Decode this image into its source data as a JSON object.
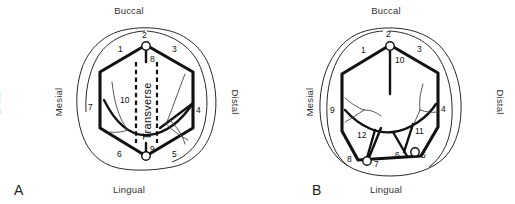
{
  "figure": {
    "background_color": "#ffffff",
    "line_color": "#111111",
    "outline_color": "#2a2a2a"
  },
  "panels": [
    {
      "letter": "A",
      "orientation": {
        "top": "Buccal",
        "bottom": "Lingual",
        "left": "Mesial",
        "right": "Distal"
      },
      "center_label": "Transverse",
      "numbers": [
        "1",
        "2",
        "3",
        "4",
        "5",
        "6",
        "7",
        "8",
        "9",
        "10"
      ],
      "nodes": [
        {
          "label": "2",
          "position": "buccal-apex"
        },
        {
          "label": "9",
          "position": "lingual-apex"
        }
      ]
    },
    {
      "letter": "B",
      "orientation": {
        "top": "Buccal",
        "bottom": "Lingual",
        "left": "Mesial",
        "right": "Distal",
        "far_left": "Distal"
      },
      "center_label": "",
      "numbers": [
        "1",
        "2",
        "3",
        "4",
        "5",
        "6",
        "7",
        "8",
        "9",
        "10",
        "11",
        "12"
      ],
      "nodes": [
        {
          "label": "2",
          "position": "buccal-apex"
        },
        {
          "label": "7",
          "position": "lingual-mesial"
        },
        {
          "label": "5",
          "position": "lingual-distal"
        }
      ]
    }
  ],
  "panel_a_numbers": {
    "n1": "1",
    "n2": "2",
    "n3": "3",
    "n4": "4",
    "n5": "5",
    "n6": "6",
    "n7": "7",
    "n8": "8",
    "n9": "9",
    "n10": "10"
  },
  "panel_b_numbers": {
    "n1": "1",
    "n2": "2",
    "n3": "3",
    "n4": "4",
    "n5": "5",
    "n6": "6",
    "n7": "7",
    "n8": "8",
    "n9": "9",
    "n10": "10",
    "n11": "11",
    "n12": "12"
  },
  "labels": {
    "buccal": "Buccal",
    "lingual": "Lingual",
    "mesial": "Mesial",
    "distal": "Distal",
    "transverse": "Transverse",
    "panel_a_letter": "A",
    "panel_b_letter": "B",
    "far_left_distal": "Distal"
  }
}
